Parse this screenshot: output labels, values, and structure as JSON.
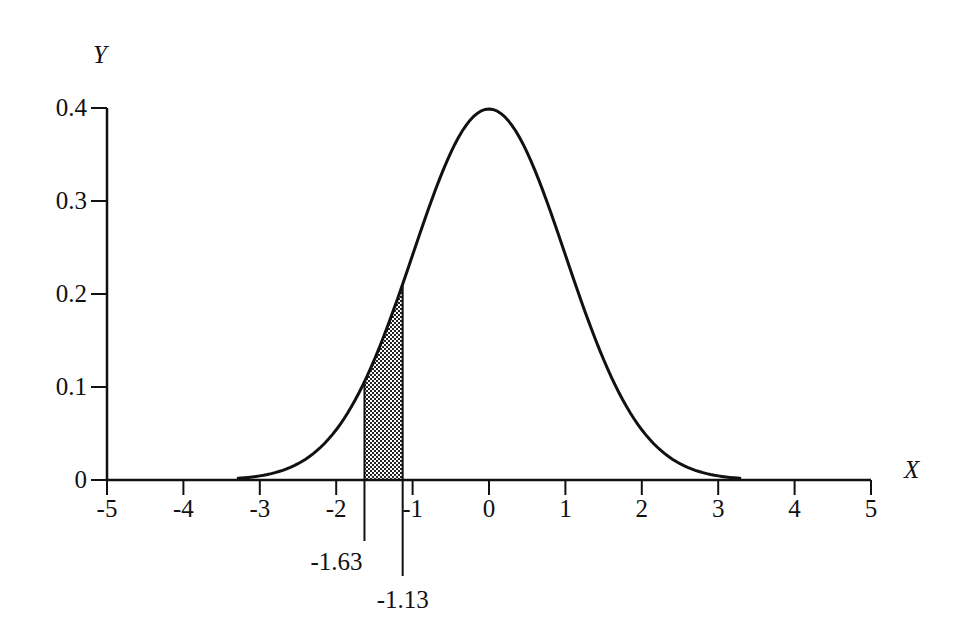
{
  "chart_data": {
    "type": "area",
    "title": "",
    "xlabel": "X",
    "ylabel": "Y",
    "xlim": [
      -5,
      5
    ],
    "ylim": [
      0,
      0.4
    ],
    "grid": false,
    "x_ticks": [
      "-5",
      "-4",
      "-3",
      "-2",
      "-1",
      "0",
      "1",
      "2",
      "3",
      "4",
      "5"
    ],
    "y_ticks": [
      "0",
      "0.1",
      "0.2",
      "0.3",
      "0.4"
    ],
    "curve": {
      "name": "Standard normal density",
      "mean": 0,
      "sd": 1,
      "x": [
        -3.3,
        -3,
        -2.5,
        -2,
        -1.63,
        -1.5,
        -1.13,
        -1,
        -0.5,
        0,
        0.5,
        1,
        1.5,
        2,
        2.5,
        3,
        3.3
      ],
      "y": [
        0.002,
        0.004,
        0.018,
        0.054,
        0.106,
        0.13,
        0.211,
        0.242,
        0.352,
        0.399,
        0.352,
        0.242,
        0.13,
        0.054,
        0.018,
        0.004,
        0.002
      ]
    },
    "shaded_region": {
      "from": -1.63,
      "to": -1.13,
      "pattern": "crosshatch"
    },
    "annotations": [
      {
        "text": "-1.63",
        "x": -1.63
      },
      {
        "text": "-1.13",
        "x": -1.13
      }
    ]
  },
  "labels": {
    "x_axis": "X",
    "y_axis": "Y",
    "lower_bound": "-1.63",
    "upper_bound": "-1.13"
  }
}
